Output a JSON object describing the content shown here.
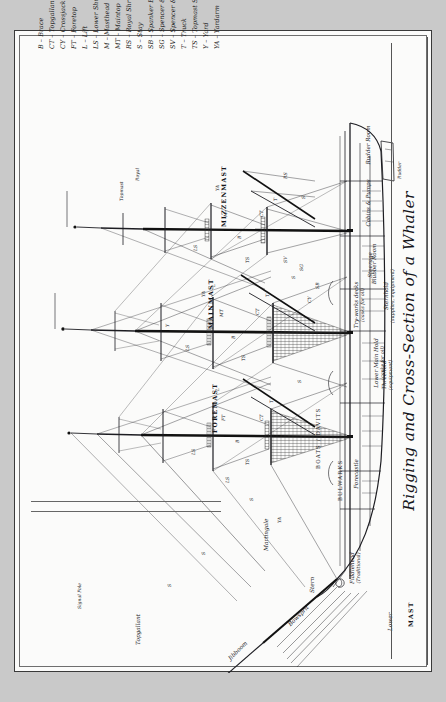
{
  "title": "Rigging and Cross-Section of a Whaler",
  "legend": {
    "items": [
      {
        "abbr": "B",
        "label": "Brace"
      },
      {
        "abbr": "CT",
        "label": "Topgallant Crosstrees"
      },
      {
        "abbr": "CY",
        "label": "Crossjack ('Crotchet') yard"
      },
      {
        "abbr": "FT",
        "label": "Foretop"
      },
      {
        "abbr": "L",
        "label": "Lift"
      },
      {
        "abbr": "LS",
        "label": "Lower Shrouds"
      },
      {
        "abbr": "M",
        "label": "Masthead (Lookout)"
      },
      {
        "abbr": "MT",
        "label": "Maintop"
      },
      {
        "abbr": "RS",
        "label": "Royal Shrouds"
      },
      {
        "abbr": "S",
        "label": "Stay"
      },
      {
        "abbr": "SB",
        "label": "Spanker Boom"
      },
      {
        "abbr": "SG",
        "label": "Spencer & Spanker Gaffs"
      },
      {
        "abbr": "SV",
        "label": "Spencer & Spanker Vangs"
      },
      {
        "abbr": "T",
        "label": "Truck"
      },
      {
        "abbr": "TS",
        "label": "Topmast Shrouds"
      },
      {
        "abbr": "Y",
        "label": "Yard"
      },
      {
        "abbr": "YA",
        "label": "Yardarm"
      }
    ]
  },
  "masts": {
    "foremast": "FOREMAST",
    "mainmast": "MAINMAST",
    "mizzenmast": "MIZZENMAST",
    "mast_axis": "MAST",
    "lower": "Lower",
    "topgallant": "Topgallant",
    "topmast_note": "Topmast",
    "royal": "Royal"
  },
  "mast_sections": [
    {
      "code": "T",
      "name": "truck"
    },
    {
      "code": "CT",
      "name": "topgallant-crosstrees"
    },
    {
      "code": "M",
      "name": "masthead"
    },
    {
      "code": "FT",
      "name": "foretop"
    },
    {
      "code": "MT",
      "name": "maintop"
    }
  ],
  "hull": {
    "compartments": [
      {
        "name": "Forecastle",
        "sub": ""
      },
      {
        "name": "Blubber Room",
        "sub": ""
      },
      {
        "name": "Try-works decks",
        "sub": "(casks for oil)"
      },
      {
        "name": "Lower Main Hold",
        "sub": "(casks for oil)"
      },
      {
        "name": "Threehold",
        "sub": "(equipment)"
      },
      {
        "name": "Sternhold",
        "sub": "(supplies, equipment)"
      },
      {
        "name": "Steerage",
        "sub": ""
      },
      {
        "name": "Cabins & Pumps",
        "sub": ""
      },
      {
        "name": "Rudder Room",
        "sub": ""
      }
    ]
  },
  "parts": {
    "bowsprit": "Bowsprit",
    "jibboom": "Jibboom",
    "martingale": "Martingale",
    "fiddlehead": "Fiddlehead",
    "fiddlehead_sub": "(Traditional)",
    "bulwarks": "BULWARKS",
    "stern": "Stern",
    "boats": "BOATS / DAVITS",
    "rudder": "Rudder",
    "signal_pole": "Signal Pole",
    "spanker": "Spanker"
  },
  "rig_codes": [
    "T",
    "CT",
    "M",
    "FT",
    "MT",
    "LS",
    "TS",
    "RS",
    "S",
    "B",
    "L",
    "Y",
    "YA",
    "CY",
    "SB",
    "SG",
    "SV"
  ],
  "colors": {
    "paper": "#fbfbfa",
    "ink": "#16161a",
    "rule": "#666666",
    "frame": "#3a3a3a"
  }
}
